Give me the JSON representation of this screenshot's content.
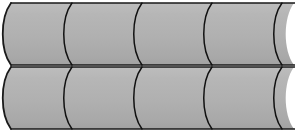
{
  "figure": {
    "canvas": {
      "width": 295,
      "height": 136,
      "background_color": "#ffffff"
    },
    "style": {
      "fill_color": "#b0b0b0",
      "fill_color_light": "#bcbcbc",
      "fill_color_dark": "#a4a4a4",
      "outline_color": "#1a1a1a",
      "outline_width": 1.6,
      "seam_color": "#111111",
      "seam_width": 1.5
    },
    "rows": [
      {
        "name": "top-row",
        "index": 1,
        "y_top": 3,
        "y_bottom": 65,
        "height": 62,
        "cap_radius_x": 11,
        "segment_count": 4,
        "segments": [
          {
            "index": 1,
            "x_start": 0,
            "x_end": 72,
            "label": "segment-1"
          },
          {
            "index": 2,
            "x_start": 72,
            "x_end": 142,
            "label": "segment-2"
          },
          {
            "index": 3,
            "x_start": 142,
            "x_end": 212,
            "label": "segment-3"
          },
          {
            "index": 4,
            "x_start": 212,
            "x_end": 282,
            "label": "segment-4"
          }
        ],
        "seam_x_positions": [
          72,
          142,
          212,
          282
        ],
        "seam_bulge": 11
      },
      {
        "name": "bottom-row",
        "index": 2,
        "y_top": 67,
        "y_bottom": 129,
        "height": 62,
        "cap_radius_x": 11,
        "segment_count": 4,
        "segments": [
          {
            "index": 1,
            "x_start": 0,
            "x_end": 72,
            "label": "segment-1"
          },
          {
            "index": 2,
            "x_start": 72,
            "x_end": 142,
            "label": "segment-2"
          },
          {
            "index": 3,
            "x_start": 142,
            "x_end": 212,
            "label": "segment-3"
          },
          {
            "index": 4,
            "x_start": 212,
            "x_end": 282,
            "label": "segment-4"
          }
        ],
        "seam_x_positions": [
          72,
          142,
          212,
          282
        ],
        "seam_bulge": 11
      }
    ],
    "clipping": {
      "right_edge_clipped": true,
      "clip_x": 295,
      "note": "Rightmost segments run past the frame boundary"
    }
  }
}
